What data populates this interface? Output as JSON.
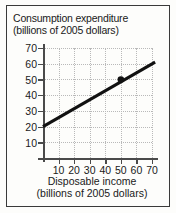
{
  "chart_data": {
    "type": "line",
    "title": "Consumption expenditure (billions of 2005 dollars)",
    "title_lines": [
      "Consumption expenditure",
      "(billions of 2005 dollars)"
    ],
    "xlabel": "Disposable income (billions of 2005 dollars)",
    "xlabel_lines": [
      "Disposable income",
      "(billions of 2005 dollars)"
    ],
    "ylabel": "Consumption expenditure (billions of 2005 dollars)",
    "xlim": [
      0,
      72
    ],
    "ylim": [
      0,
      72
    ],
    "xticks": [
      10,
      20,
      30,
      40,
      50,
      60,
      70
    ],
    "yticks": [
      10,
      20,
      30,
      40,
      50,
      60,
      70
    ],
    "xtick_labels": [
      "10",
      "20",
      "30",
      "40",
      "50",
      "60",
      "70"
    ],
    "ytick_labels": [
      "10",
      "20",
      "30",
      "40",
      "50",
      "60",
      "70"
    ],
    "grid": true,
    "grid_style": "dotted",
    "legend": false,
    "line_color": "#111111",
    "grid_color": "#b9b9b9",
    "axis_color": "#4a4a4a",
    "series": [
      {
        "name": "Consumption function",
        "x": [
          0,
          72
        ],
        "y": [
          20,
          61
        ],
        "intercept": 20,
        "slope": 0.57
      }
    ],
    "markers": [
      {
        "name": "point-a",
        "x": 50,
        "y": 50,
        "label": ""
      }
    ]
  },
  "figure": {
    "title_line_1": "Consumption expenditure",
    "title_line_2": "(billions of 2005 dollars)",
    "x_caption_line_1": "Disposable income",
    "x_caption_line_2": "(billions of 2005 dollars)"
  }
}
